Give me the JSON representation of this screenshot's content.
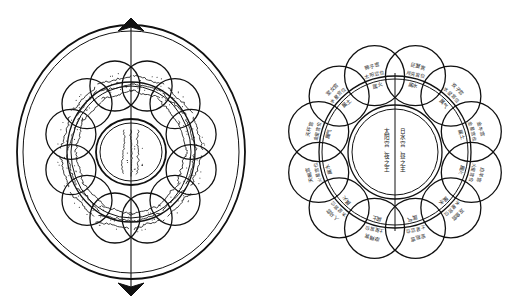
{
  "figure": {
    "type": "diagram",
    "panels": [
      {
        "id": "left",
        "name": "arabic-manuscript-rosette"
      },
      {
        "id": "right",
        "name": "chinese-zodiac-rulership-wheel"
      }
    ]
  },
  "left_diagram": {
    "name": "arabic-rosette",
    "outer_rings": 2,
    "lobe_count": 12,
    "has_vertical_axis_arrow": true,
    "axis_arrow_ends": [
      "top",
      "bottom"
    ],
    "center_label": "الشمس",
    "center_script": "arabic",
    "lobe_script": "arabic",
    "lobe_labels": [
      "برج الأسد",
      "برج السرطان",
      "برج الجوزاء",
      "برج الثور",
      "برج الحمل",
      "برج الحوت",
      "برج الدلو",
      "برج الجدي",
      "برج القوس",
      "برج العقرب",
      "برج الميزان",
      "برج السنبلة"
    ]
  },
  "right_diagram": {
    "name": "chinese-zodiac-rulership-wheel",
    "lobe_count": 12,
    "has_vertical_divider": true,
    "center": {
      "column_right": "日水宫、昼之主",
      "column_left": "太阳宫、夜之王"
    },
    "houses": [
      {
        "angle_deg": -75,
        "sign": "巨蟹宫",
        "ruler": "月亮宫位",
        "element": "属水"
      },
      {
        "angle_deg": -45,
        "sign": "双子宫",
        "ruler": "水星宫位",
        "element": "属气"
      },
      {
        "angle_deg": -15,
        "sign": "金牛宫",
        "ruler": "金星宫位",
        "element": "属土"
      },
      {
        "angle_deg": 15,
        "sign": "白羊宫",
        "ruler": "火星宫位",
        "element": "属火"
      },
      {
        "angle_deg": 45,
        "sign": "双鱼宫",
        "ruler": "木星宫位",
        "element": "属水"
      },
      {
        "angle_deg": 75,
        "sign": "宝瓶宫",
        "ruler": "土星宫位",
        "element": "属气"
      },
      {
        "angle_deg": 105,
        "sign": "摩羯宫",
        "ruler": "土星宫位",
        "element": "属土"
      },
      {
        "angle_deg": 135,
        "sign": "人马宫",
        "ruler": "木星宫位",
        "element": "属火"
      },
      {
        "angle_deg": 165,
        "sign": "天蝎宫",
        "ruler": "火星宫位",
        "element": "属水"
      },
      {
        "angle_deg": 195,
        "sign": "天秤宫",
        "ruler": "金星宫位",
        "element": "属气"
      },
      {
        "angle_deg": 225,
        "sign": "室女宫",
        "ruler": "水星宫位",
        "element": "属土"
      },
      {
        "angle_deg": 255,
        "sign": "狮子宫",
        "ruler": "太阳宫位",
        "element": "属火"
      }
    ]
  },
  "colors": {
    "ink": "#111111",
    "background": "#ffffff",
    "text": "#1a1a1a"
  }
}
